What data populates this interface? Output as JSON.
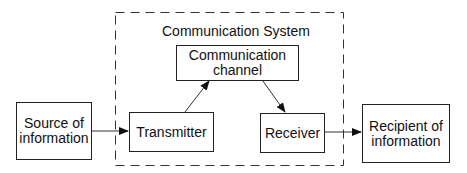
{
  "diagram": {
    "system_title": "Communication System",
    "nodes": {
      "source": {
        "label_line1": "Source of",
        "label_line2": "information"
      },
      "transmitter": {
        "label": "Transmitter"
      },
      "channel": {
        "label_line1": "Communication",
        "label_line2": "channel"
      },
      "receiver": {
        "label": "Receiver"
      },
      "recipient": {
        "label_line1": "Recipient of",
        "label_line2": "information"
      }
    },
    "edges": [
      {
        "from": "source",
        "to": "transmitter"
      },
      {
        "from": "transmitter",
        "to": "channel"
      },
      {
        "from": "channel",
        "to": "receiver"
      },
      {
        "from": "receiver",
        "to": "recipient"
      }
    ],
    "colors": {
      "stroke": "#222222",
      "background": "#ffffff"
    }
  }
}
